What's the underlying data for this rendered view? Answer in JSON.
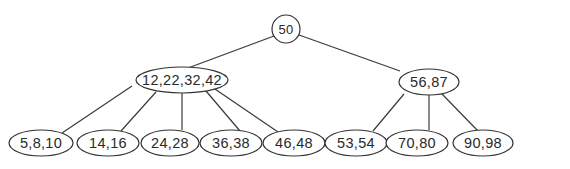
{
  "diagram": {
    "type": "b-tree",
    "nodes": {
      "root": {
        "keys": "50",
        "cx": 286,
        "cy": 29,
        "rx": 14,
        "ry": 14
      },
      "l1_left": {
        "keys": "12,22,32,42",
        "cx": 172,
        "cy": 80,
        "rx": 46,
        "ry": 13
      },
      "l1_right": {
        "keys": "56,87",
        "cx": 416,
        "cy": 82,
        "rx": 30,
        "ry": 13
      },
      "leaf0": {
        "keys": "5,8,10",
        "cx": 41,
        "cy": 143,
        "rx": 32,
        "ry": 13
      },
      "leaf1": {
        "keys": "14,16",
        "cx": 108,
        "cy": 143,
        "rx": 31,
        "ry": 13
      },
      "leaf2": {
        "keys": "24,28",
        "cx": 169,
        "cy": 143,
        "rx": 29,
        "ry": 13
      },
      "leaf3": {
        "keys": "36,38",
        "cx": 232,
        "cy": 143,
        "rx": 31,
        "ry": 13
      },
      "leaf4": {
        "keys": "46,48",
        "cx": 296,
        "cy": 143,
        "rx": 31,
        "ry": 13
      },
      "leaf5": {
        "keys": "53,54",
        "cx": 358,
        "cy": 143,
        "rx": 31,
        "ry": 13
      },
      "leaf6": {
        "keys": "70,80",
        "cx": 420,
        "cy": 143,
        "rx": 31,
        "ry": 13
      },
      "leaf7": {
        "keys": "90,98",
        "cx": 486,
        "cy": 143,
        "rx": 31,
        "ry": 13
      }
    },
    "edges": [
      [
        "root",
        "l1_left"
      ],
      [
        "root",
        "l1_right"
      ],
      [
        "l1_left",
        "leaf0"
      ],
      [
        "l1_left",
        "leaf1"
      ],
      [
        "l1_left",
        "leaf2"
      ],
      [
        "l1_left",
        "leaf3"
      ],
      [
        "l1_left",
        "leaf4"
      ],
      [
        "l1_right",
        "leaf5"
      ],
      [
        "l1_right",
        "leaf6"
      ],
      [
        "l1_right",
        "leaf7"
      ]
    ]
  }
}
